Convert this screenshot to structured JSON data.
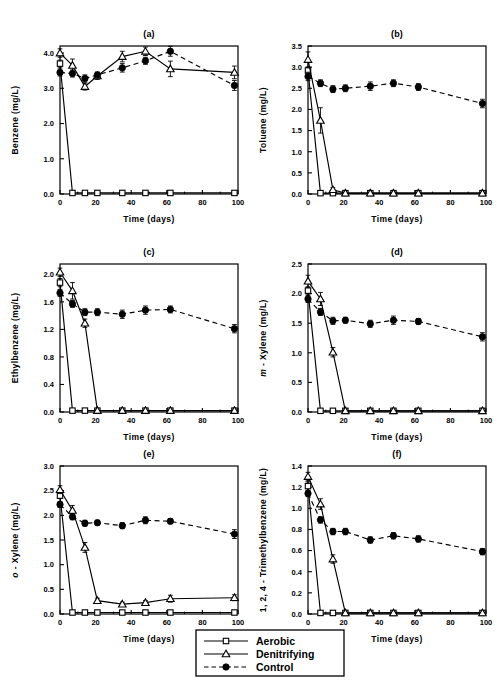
{
  "figure": {
    "panel_letters": [
      "(a)",
      "(b)",
      "(c)",
      "(d)",
      "(e)",
      "(f)"
    ],
    "xlabel": "Time  (days)",
    "background_color": "#ffffff",
    "line_color": "#000000"
  },
  "legend": {
    "items": [
      {
        "label": "Aerobic",
        "marker": "open-square",
        "line": "solid"
      },
      {
        "label": "Denitrifying",
        "marker": "open-triangle",
        "line": "solid"
      },
      {
        "label": "Control",
        "marker": "filled-circle",
        "line": "dashed"
      }
    ]
  },
  "chart_data": [
    {
      "type": "line",
      "title": "(a)",
      "xlabel": "Time  (days)",
      "ylabel": "Benzene  (mg/L)",
      "ylabel_italic_prefix": "",
      "xlim": [
        0,
        100
      ],
      "ylim": [
        0.0,
        4.2
      ],
      "xticks": [
        0,
        20,
        40,
        60,
        80,
        100
      ],
      "yticks": [
        0.0,
        1.0,
        2.0,
        3.0,
        4.0
      ],
      "ytick_labels": [
        "0.0",
        "1.0",
        "2.0",
        "3.0",
        "4.0"
      ],
      "grid": false,
      "legend_position": "external-bottom",
      "series": [
        {
          "name": "Aerobic",
          "marker": "open-square",
          "line": "solid",
          "x": [
            0,
            7,
            14,
            21,
            35,
            48,
            62,
            98
          ],
          "values": [
            3.7,
            0.03,
            0.03,
            0.03,
            0.03,
            0.03,
            0.03,
            0.03
          ],
          "errors": [
            0.1,
            0.0,
            0.0,
            0.0,
            0.0,
            0.0,
            0.0,
            0.0
          ]
        },
        {
          "name": "Denitrifying",
          "marker": "open-triangle",
          "line": "solid",
          "x": [
            0,
            7,
            14,
            21,
            35,
            48,
            62,
            98
          ],
          "values": [
            4.0,
            3.65,
            3.05,
            3.35,
            3.9,
            4.05,
            3.55,
            3.45
          ],
          "errors": [
            0.12,
            0.18,
            0.1,
            0.1,
            0.15,
            0.12,
            0.22,
            0.18
          ]
        },
        {
          "name": "Control",
          "marker": "filled-circle",
          "line": "dashed",
          "x": [
            0,
            7,
            14,
            21,
            35,
            48,
            62,
            98
          ],
          "values": [
            3.45,
            3.42,
            3.28,
            3.38,
            3.58,
            3.78,
            4.05,
            3.08
          ],
          "errors": [
            0.1,
            0.1,
            0.1,
            0.08,
            0.12,
            0.1,
            0.14,
            0.14
          ]
        }
      ]
    },
    {
      "type": "line",
      "title": "(b)",
      "xlabel": "Time  (days)",
      "ylabel": "Toluene  (mg/L)",
      "ylabel_italic_prefix": "",
      "xlim": [
        0,
        100
      ],
      "ylim": [
        0.0,
        3.5
      ],
      "xticks": [
        0,
        20,
        40,
        60,
        80,
        100
      ],
      "yticks": [
        0.0,
        0.5,
        1.0,
        1.5,
        2.0,
        2.5,
        3.0,
        3.5
      ],
      "ytick_labels": [
        "0.0",
        "0.5",
        "1.0",
        "1.5",
        "2.0",
        "2.5",
        "3.0",
        "3.5"
      ],
      "grid": false,
      "legend_position": "external-bottom",
      "series": [
        {
          "name": "Aerobic",
          "marker": "open-square",
          "line": "solid",
          "x": [
            0,
            7,
            14,
            21,
            35,
            48,
            62,
            98
          ],
          "values": [
            2.92,
            0.02,
            0.02,
            0.02,
            0.02,
            0.02,
            0.02,
            0.02
          ],
          "errors": [
            0.08,
            0.0,
            0.0,
            0.0,
            0.0,
            0.0,
            0.0,
            0.0
          ]
        },
        {
          "name": "Denitrifying",
          "marker": "open-triangle",
          "line": "solid",
          "x": [
            0,
            7,
            14,
            21,
            35,
            48,
            62,
            98
          ],
          "values": [
            3.18,
            1.74,
            0.1,
            0.02,
            0.02,
            0.02,
            0.02,
            0.02
          ],
          "errors": [
            0.18,
            0.3,
            0.05,
            0.0,
            0.0,
            0.0,
            0.0,
            0.0
          ]
        },
        {
          "name": "Control",
          "marker": "filled-circle",
          "line": "dashed",
          "x": [
            0,
            7,
            14,
            21,
            35,
            48,
            62,
            98
          ],
          "values": [
            2.78,
            2.62,
            2.48,
            2.5,
            2.55,
            2.62,
            2.53,
            2.14
          ],
          "errors": [
            0.1,
            0.08,
            0.08,
            0.08,
            0.1,
            0.08,
            0.08,
            0.1
          ]
        }
      ]
    },
    {
      "type": "line",
      "title": "(c)",
      "xlabel": "Time  (days)",
      "ylabel": "Ethylbenzene  (mg/L)",
      "ylabel_italic_prefix": "",
      "xlim": [
        0,
        100
      ],
      "ylim": [
        0.0,
        2.15
      ],
      "xticks": [
        0,
        20,
        40,
        60,
        80,
        100
      ],
      "yticks": [
        0.0,
        0.4,
        0.8,
        1.2,
        1.6,
        2.0
      ],
      "ytick_labels": [
        "0.0",
        "0.4",
        "0.8",
        "1.2",
        "1.6",
        "2.0"
      ],
      "grid": false,
      "legend_position": "external-bottom",
      "series": [
        {
          "name": "Aerobic",
          "marker": "open-square",
          "line": "solid",
          "x": [
            0,
            7,
            14,
            21,
            35,
            48,
            62,
            98
          ],
          "values": [
            1.88,
            0.02,
            0.02,
            0.02,
            0.02,
            0.02,
            0.02,
            0.02
          ],
          "errors": [
            0.06,
            0.0,
            0.0,
            0.0,
            0.0,
            0.0,
            0.0,
            0.0
          ]
        },
        {
          "name": "Denitrifying",
          "marker": "open-triangle",
          "line": "solid",
          "x": [
            0,
            7,
            14,
            21,
            35,
            48,
            62,
            98
          ],
          "values": [
            2.03,
            1.76,
            1.29,
            0.02,
            0.02,
            0.02,
            0.02,
            0.02
          ],
          "errors": [
            0.06,
            0.12,
            0.06,
            0.0,
            0.0,
            0.0,
            0.0,
            0.0
          ]
        },
        {
          "name": "Control",
          "marker": "filled-circle",
          "line": "dashed",
          "x": [
            0,
            7,
            14,
            21,
            35,
            48,
            62,
            98
          ],
          "values": [
            1.73,
            1.57,
            1.45,
            1.45,
            1.42,
            1.48,
            1.49,
            1.21
          ],
          "errors": [
            0.05,
            0.05,
            0.05,
            0.05,
            0.06,
            0.06,
            0.05,
            0.06
          ]
        }
      ]
    },
    {
      "type": "line",
      "title": "(d)",
      "xlabel": "Time  (days)",
      "ylabel": "Xylene  (mg/L)",
      "ylabel_italic_prefix": "m -",
      "xlim": [
        0,
        100
      ],
      "ylim": [
        0.0,
        2.5
      ],
      "xticks": [
        0,
        20,
        40,
        60,
        80,
        100
      ],
      "yticks": [
        0.0,
        0.5,
        1.0,
        1.5,
        2.0,
        2.5
      ],
      "ytick_labels": [
        "0.0",
        "0.5",
        "1.0",
        "1.5",
        "2.0",
        "2.5"
      ],
      "grid": false,
      "legend_position": "external-bottom",
      "series": [
        {
          "name": "Aerobic",
          "marker": "open-square",
          "line": "solid",
          "x": [
            0,
            7,
            14,
            21,
            35,
            48,
            62,
            98
          ],
          "values": [
            2.05,
            0.02,
            0.02,
            0.02,
            0.02,
            0.02,
            0.02,
            0.02
          ],
          "errors": [
            0.06,
            0.0,
            0.0,
            0.0,
            0.0,
            0.0,
            0.0,
            0.0
          ]
        },
        {
          "name": "Denitrifying",
          "marker": "open-triangle",
          "line": "solid",
          "x": [
            0,
            7,
            14,
            21,
            35,
            48,
            62,
            98
          ],
          "values": [
            2.21,
            1.91,
            1.01,
            0.02,
            0.02,
            0.02,
            0.02,
            0.02
          ],
          "errors": [
            0.1,
            0.11,
            0.08,
            0.0,
            0.0,
            0.0,
            0.0,
            0.0
          ]
        },
        {
          "name": "Control",
          "marker": "filled-circle",
          "line": "dashed",
          "x": [
            0,
            7,
            14,
            21,
            35,
            48,
            62,
            98
          ],
          "values": [
            1.91,
            1.69,
            1.54,
            1.55,
            1.49,
            1.55,
            1.53,
            1.27
          ],
          "errors": [
            0.06,
            0.06,
            0.06,
            0.05,
            0.06,
            0.07,
            0.05,
            0.07
          ]
        }
      ]
    },
    {
      "type": "line",
      "title": "(e)",
      "xlabel": "Time  (days)",
      "ylabel": "Xylene  (mg/L)",
      "ylabel_italic_prefix": "o -",
      "xlim": [
        0,
        100
      ],
      "ylim": [
        0.0,
        3.0
      ],
      "xticks": [
        0,
        20,
        40,
        60,
        80,
        100
      ],
      "yticks": [
        0.0,
        0.5,
        1.0,
        1.5,
        2.0,
        2.5,
        3.0
      ],
      "ytick_labels": [
        "0.0",
        "0.5",
        "1.0",
        "1.5",
        "2.0",
        "2.5",
        "3.0"
      ],
      "grid": false,
      "legend_position": "external-bottom",
      "series": [
        {
          "name": "Aerobic",
          "marker": "open-square",
          "line": "solid",
          "x": [
            0,
            7,
            14,
            21,
            35,
            48,
            62,
            98
          ],
          "values": [
            2.4,
            0.03,
            0.03,
            0.03,
            0.03,
            0.03,
            0.03,
            0.03
          ],
          "errors": [
            0.06,
            0.0,
            0.0,
            0.0,
            0.0,
            0.0,
            0.0,
            0.0
          ]
        },
        {
          "name": "Denitrifying",
          "marker": "open-triangle",
          "line": "solid",
          "x": [
            0,
            7,
            14,
            21,
            35,
            48,
            62,
            98
          ],
          "values": [
            2.52,
            2.1,
            1.35,
            0.27,
            0.2,
            0.23,
            0.31,
            0.33
          ],
          "errors": [
            0.08,
            0.1,
            0.1,
            0.05,
            0.04,
            0.04,
            0.07,
            0.06
          ]
        },
        {
          "name": "Control",
          "marker": "filled-circle",
          "line": "dashed",
          "x": [
            0,
            7,
            14,
            21,
            35,
            48,
            62,
            98
          ],
          "values": [
            2.22,
            1.97,
            1.84,
            1.85,
            1.79,
            1.9,
            1.88,
            1.62
          ],
          "errors": [
            0.06,
            0.06,
            0.06,
            0.05,
            0.06,
            0.07,
            0.05,
            0.09
          ]
        }
      ]
    },
    {
      "type": "line",
      "title": "(f)",
      "xlabel": "Time  (days)",
      "ylabel": "1, 2, 4 - Trimethylbenzene  (mg/L)",
      "ylabel_italic_prefix": "",
      "xlim": [
        0,
        100
      ],
      "ylim": [
        0.0,
        1.4
      ],
      "xticks": [
        0,
        20,
        40,
        60,
        80,
        100
      ],
      "yticks": [
        0.0,
        0.2,
        0.4,
        0.6,
        0.8,
        1.0,
        1.2,
        1.4
      ],
      "ytick_labels": [
        "0.0",
        "0.2",
        "0.4",
        "0.6",
        "0.8",
        "1.0",
        "1.2",
        "1.4"
      ],
      "grid": false,
      "legend_position": "external-bottom",
      "series": [
        {
          "name": "Aerobic",
          "marker": "open-square",
          "line": "solid",
          "x": [
            0,
            7,
            14,
            21,
            35,
            48,
            62,
            98
          ],
          "values": [
            1.21,
            0.01,
            0.01,
            0.01,
            0.01,
            0.01,
            0.01,
            0.01
          ],
          "errors": [
            0.04,
            0.0,
            0.0,
            0.0,
            0.0,
            0.0,
            0.0,
            0.0
          ]
        },
        {
          "name": "Denitrifying",
          "marker": "open-triangle",
          "line": "solid",
          "x": [
            0,
            7,
            14,
            21,
            35,
            48,
            62,
            98
          ],
          "values": [
            1.3,
            1.04,
            0.52,
            0.01,
            0.01,
            0.01,
            0.01,
            0.01
          ],
          "errors": [
            0.04,
            0.05,
            0.04,
            0.0,
            0.0,
            0.0,
            0.0,
            0.0
          ]
        },
        {
          "name": "Control",
          "marker": "filled-circle",
          "line": "dashed",
          "x": [
            0,
            7,
            14,
            21,
            35,
            48,
            62,
            98
          ],
          "values": [
            1.14,
            0.89,
            0.78,
            0.78,
            0.7,
            0.74,
            0.71,
            0.59
          ],
          "errors": [
            0.03,
            0.03,
            0.03,
            0.03,
            0.03,
            0.03,
            0.03,
            0.03
          ]
        }
      ]
    }
  ]
}
